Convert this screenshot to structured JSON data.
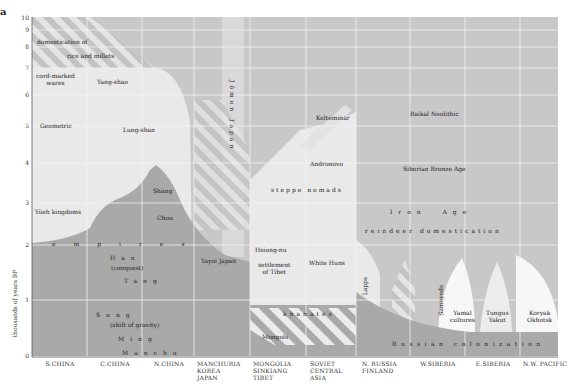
{
  "figure": {
    "panel_letter": "a",
    "y_axis_label": "thousands of years BP",
    "y_ticks": [
      "10",
      "9",
      "8",
      "7",
      "6",
      "5",
      "4",
      "3",
      "2",
      "1",
      "0"
    ],
    "columns": [
      {
        "label": "S.CHINA"
      },
      {
        "label": "C.CHINA"
      },
      {
        "label": "N.CHINA"
      },
      {
        "label": "MANCHURIA\nKOREA\nJAPAN"
      },
      {
        "label": "MONGOLIA\nSINKIANG\nTIBET"
      },
      {
        "label": "SOVIET\nCENTRAL\nASIA"
      },
      {
        "label": "N. RUSSIA\nFINLAND"
      },
      {
        "label": "W.SIBERIA"
      },
      {
        "label": "E.SIBERIA"
      },
      {
        "label": "N.W. PACIFIC"
      }
    ],
    "labels": {
      "domestication": "domestication of",
      "rice_millets": "rice and millets",
      "cord_marked": "cord-marked\nwares",
      "yang_shao": "Yang-shao",
      "geometric": "Geometric",
      "lung_shan": "Lung-shan",
      "jomon": "Jōmon Japan",
      "keltemin": "Kelteminar",
      "baikal": "Baikal Neolithic",
      "andronovo": "Andronovo",
      "siberian_bronze": "Siberian Bronze Age",
      "steppe": "steppe nomads",
      "shang": "Shang",
      "chou": "Chou",
      "yueh": "Yüeh kingdoms",
      "iron_age": "Iron  Age",
      "reindeer": "reindeer domestication",
      "empires": "empires",
      "hsiung_nu": "Hsiung-nu",
      "han": "Han",
      "han_sub": "(conquest)",
      "yayoi": "Yayoi Japan",
      "tibet": "settlement\nof Tibet",
      "white_huns": "White Huns",
      "tang": "Tang",
      "lapps": "Lapps",
      "samoyeds": "Samoyeds",
      "yamal": "Yamal\ncultures",
      "tungus": "Tungus\nYakut",
      "koryak": "Koryak\nOkhotsk",
      "sung": "Sung",
      "sung_sub": "(shift of gravity)",
      "khanates": "khanates",
      "ming": "Ming",
      "mongols": "Mongols",
      "russian": "Russian colonization",
      "manchu": "Manchu"
    },
    "colors": {
      "background_gray": "#c8c8c8",
      "light_region": "#e9e9e9",
      "dark_region": "#a9a9a9",
      "white_region": "#f7f7f7",
      "grid": "#f2f2f2"
    }
  }
}
